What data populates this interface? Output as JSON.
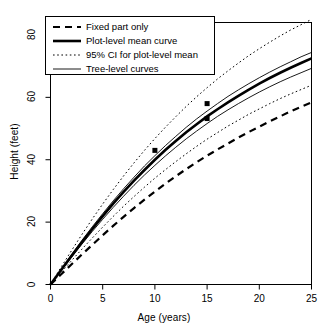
{
  "chart_data": {
    "type": "line",
    "title": "",
    "xlabel": "Age (years)",
    "ylabel": "Height (feet)",
    "xlim": [
      0,
      25
    ],
    "ylim": [
      0,
      84
    ],
    "xticks": [
      0,
      5,
      10,
      15,
      20,
      25
    ],
    "yticks": [
      0,
      20,
      40,
      60,
      80
    ],
    "grid": false,
    "legend_position": "top-left",
    "legend": [
      "Fixed part only",
      "Plot-level mean curve",
      "95% CI for plot-level mean",
      "Tree-level curves"
    ],
    "x": [
      0,
      1,
      2,
      3,
      4,
      5,
      6,
      7,
      8,
      9,
      10,
      11,
      12,
      13,
      14,
      15,
      16,
      17,
      18,
      19,
      20,
      21,
      22,
      23,
      24,
      25
    ],
    "series": [
      {
        "name": "Fixed part only",
        "style": "dashed",
        "values": [
          0,
          3.2,
          6.4,
          9.6,
          12.7,
          15.8,
          18.8,
          21.7,
          24.5,
          27.2,
          29.8,
          32.3,
          34.7,
          37.0,
          39.2,
          41.3,
          43.3,
          45.2,
          47.1,
          48.9,
          50.6,
          52.3,
          53.9,
          55.5,
          57.0,
          58.4
        ]
      },
      {
        "name": "Plot-level mean curve",
        "style": "solid-thick",
        "values": [
          0,
          4.6,
          9.1,
          13.5,
          17.8,
          21.9,
          25.9,
          29.7,
          33.3,
          36.7,
          40.0,
          43.1,
          46.0,
          48.8,
          51.4,
          53.9,
          56.2,
          58.4,
          60.5,
          62.5,
          64.4,
          66.2,
          67.9,
          69.5,
          71.0,
          72.5
        ]
      },
      {
        "name": "95% CI lower for plot-level mean",
        "style": "dotted",
        "values": [
          0,
          3.8,
          7.6,
          11.3,
          14.9,
          18.4,
          21.8,
          25.1,
          28.2,
          31.2,
          34.1,
          36.8,
          39.4,
          41.9,
          44.3,
          46.6,
          48.7,
          50.8,
          52.7,
          54.6,
          56.3,
          58.0,
          59.6,
          61.1,
          62.5,
          63.9
        ]
      },
      {
        "name": "95% CI upper for plot-level mean",
        "style": "dotted",
        "values": [
          0,
          5.5,
          10.8,
          16.0,
          21.0,
          25.8,
          30.4,
          34.8,
          39.0,
          43.0,
          46.8,
          50.4,
          53.8,
          57.1,
          60.2,
          63.1,
          65.9,
          68.5,
          71.0,
          73.4,
          75.6,
          77.7,
          79.7,
          81.6,
          83.3,
          85.0
        ]
      },
      {
        "name": "Tree-level curve 1",
        "style": "solid-thin",
        "values": [
          0,
          4.8,
          9.5,
          14.1,
          18.5,
          22.7,
          26.8,
          30.7,
          34.4,
          38.0,
          41.3,
          44.5,
          47.5,
          50.4,
          53.1,
          55.6,
          58.0,
          60.3,
          62.4,
          64.4,
          66.3,
          68.1,
          69.8,
          71.4,
          73.0,
          74.4
        ]
      },
      {
        "name": "Tree-level curve 2",
        "style": "solid-thin",
        "values": [
          0,
          4.4,
          8.7,
          12.9,
          17.0,
          20.9,
          24.7,
          28.3,
          31.8,
          35.1,
          38.2,
          41.2,
          44.0,
          46.7,
          49.2,
          51.6,
          53.9,
          56.0,
          58.0,
          59.9,
          61.7,
          63.4,
          65.0,
          66.5,
          67.9,
          69.3
        ]
      }
    ],
    "markers": [
      {
        "x": 10,
        "y": 43.0
      },
      {
        "x": 15,
        "y": 58.0
      },
      {
        "x": 15,
        "y": 53.2
      }
    ]
  },
  "colors": {
    "foreground": "#000000",
    "background": "#ffffff"
  }
}
